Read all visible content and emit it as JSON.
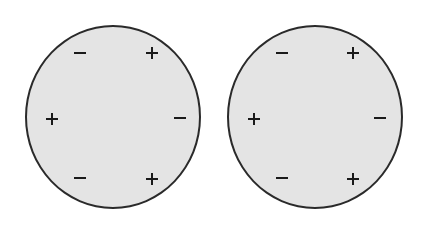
{
  "figure": {
    "colors": {
      "disc_fill": "#e4e4e4",
      "outline": "#2a2a2a",
      "sign": "#1a1a1a"
    },
    "discs": [
      {
        "id": "left",
        "signs": [
          {
            "symbol": "minus",
            "x": 80,
            "y": 53
          },
          {
            "symbol": "plus",
            "x": 152,
            "y": 53
          },
          {
            "symbol": "plus",
            "x": 52,
            "y": 119
          },
          {
            "symbol": "minus",
            "x": 180,
            "y": 118
          },
          {
            "symbol": "minus",
            "x": 80,
            "y": 178
          },
          {
            "symbol": "plus",
            "x": 152,
            "y": 179
          }
        ]
      },
      {
        "id": "right",
        "signs": [
          {
            "symbol": "minus",
            "x": 282,
            "y": 53
          },
          {
            "symbol": "plus",
            "x": 353,
            "y": 53
          },
          {
            "symbol": "plus",
            "x": 254,
            "y": 119
          },
          {
            "symbol": "minus",
            "x": 380,
            "y": 118
          },
          {
            "symbol": "minus",
            "x": 282,
            "y": 178
          },
          {
            "symbol": "plus",
            "x": 353,
            "y": 179
          }
        ]
      }
    ]
  }
}
